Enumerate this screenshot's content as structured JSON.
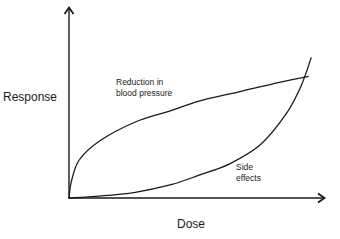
{
  "chart_data": {
    "type": "line",
    "title": "",
    "xlabel": "Dose",
    "ylabel": "Response",
    "xlim": [
      0,
      100
    ],
    "ylim": [
      0,
      100
    ],
    "grid": false,
    "legend": "none",
    "ticks": "none",
    "annotations": [
      {
        "text": "Reduction in blood pressure",
        "lines": [
          "Reduction in",
          "blood pressure"
        ],
        "near_series": "Reduction in blood pressure"
      },
      {
        "text": "Side effects",
        "lines": [
          "Side",
          "effects"
        ],
        "near_series": "Side effects"
      }
    ],
    "series": [
      {
        "name": "Reduction in blood pressure",
        "shape": "concave, rising quickly then leveling off",
        "x": [
          0,
          1,
          4,
          12,
          26,
          40,
          51,
          67,
          83,
          94
        ],
        "y": [
          0,
          9,
          20,
          30,
          40,
          46,
          51,
          56,
          61,
          64
        ]
      },
      {
        "name": "Side effects",
        "shape": "convex, flat at low dose then rising steeply",
        "x": [
          0,
          12,
          26,
          40,
          51,
          63,
          75,
          85,
          91,
          95
        ],
        "y": [
          0,
          1,
          3,
          7,
          12,
          18,
          28,
          44,
          59,
          74
        ]
      }
    ],
    "crossover": {
      "x": 91,
      "y": 63
    }
  },
  "labels": {
    "y_axis": "Response",
    "x_axis": "Dose",
    "curve1_line1": "Reduction in",
    "curve1_line2": "blood pressure",
    "curve2_line1": "Side",
    "curve2_line2": "effects"
  },
  "colors": {
    "ink": "#1a1a1a",
    "background": "#ffffff"
  }
}
